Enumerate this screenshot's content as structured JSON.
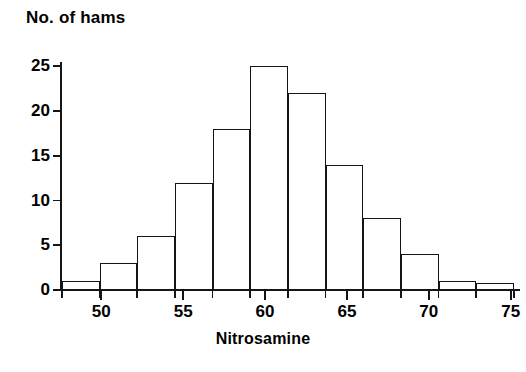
{
  "chart_data": {
    "type": "bar",
    "title": "No. of hams",
    "subtitle": "",
    "xlabel": "Nitrosamine",
    "ylabel": "No. of hams",
    "xlim": [
      47.6,
      75.2
    ],
    "ylim": [
      0,
      25.5
    ],
    "grid": false,
    "legend": null,
    "bin_width": 2.3,
    "categories": [
      "47.6-49.9",
      "49.9-52.2",
      "52.2-54.5",
      "54.5-56.8",
      "56.8-59.1",
      "59.1-61.4",
      "61.4-63.7",
      "63.7-66.0",
      "66.0-68.3",
      "68.3-70.6",
      "70.6-72.9",
      "72.9-75.2"
    ],
    "bin_edges": [
      47.6,
      49.9,
      52.2,
      54.5,
      56.8,
      59.1,
      61.4,
      63.7,
      66.0,
      68.3,
      70.6,
      72.9,
      75.2
    ],
    "values": [
      1,
      3,
      6,
      12,
      18,
      25,
      22,
      14,
      8,
      4,
      1,
      0.8
    ],
    "x_ticks": [
      50,
      55,
      60,
      65,
      70,
      75
    ],
    "x_tick_labels": [
      "50",
      "55",
      "60",
      "65",
      "70",
      "75"
    ],
    "y_ticks": [
      0,
      5,
      10,
      15,
      20,
      25
    ],
    "y_tick_labels": [
      "0",
      "5",
      "10",
      "15",
      "20",
      "25"
    ],
    "bar_fill_color": "#ffffff",
    "bar_edge_color": "#151515",
    "axis_color": "#151515",
    "background_color": "#ffffff"
  }
}
